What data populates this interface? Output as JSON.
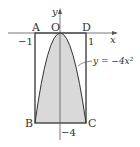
{
  "diagram": {
    "axes": {
      "x_label": "x",
      "y_label": "y",
      "origin_label": "O"
    },
    "points": {
      "A": "A",
      "B": "B",
      "C": "C",
      "D": "D"
    },
    "ticks": {
      "x_neg": "−1",
      "x_pos": "1",
      "y_neg": "−4"
    },
    "curve_label": "y = −4x²",
    "colors": {
      "line": "#333333",
      "fill": "#d9d9d9",
      "background": "#ffffff"
    }
  }
}
